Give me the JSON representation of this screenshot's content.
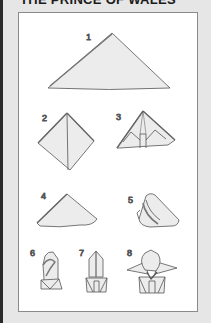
{
  "title": "THE PRINCE OF WALES",
  "colors": {
    "background": "#e6e6e6",
    "panel": "#ffffff",
    "napkin_fill": "#ececec",
    "line": "#555555"
  },
  "steps": [
    {
      "number": "1",
      "shape": "triangle"
    },
    {
      "number": "2",
      "shape": "diamond-fold"
    },
    {
      "number": "3",
      "shape": "pleated-triangle"
    },
    {
      "number": "4",
      "shape": "triangle-flipped"
    },
    {
      "number": "5",
      "shape": "rolled-side"
    },
    {
      "number": "6",
      "shape": "rolled-tube"
    },
    {
      "number": "7",
      "shape": "standing-fold"
    },
    {
      "number": "8",
      "shape": "prince-of-wales-finished"
    }
  ]
}
